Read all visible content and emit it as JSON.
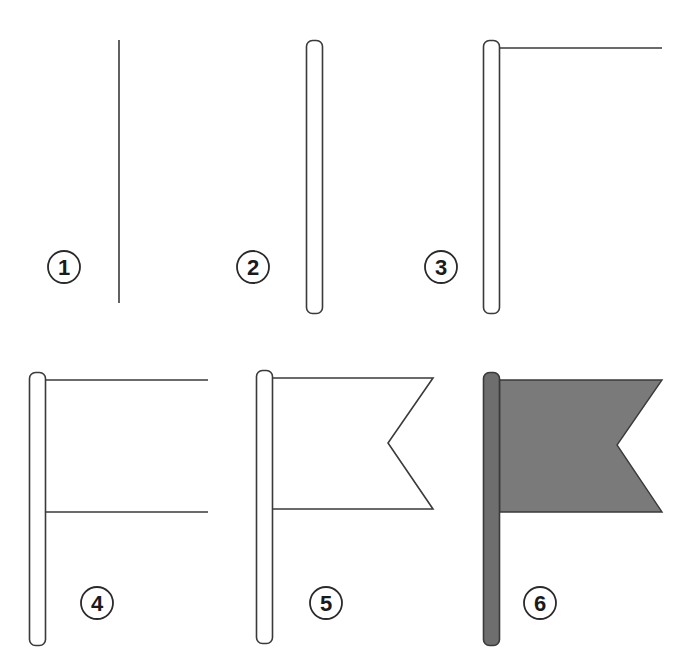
{
  "colors": {
    "background": "#ffffff",
    "stroke": "#3a3a3a",
    "pole_fill_final": "#6e6e6e",
    "flag_fill_final": "#7a7a7a"
  },
  "steps": [
    {
      "number": "1",
      "description": "Draw a vertical line"
    },
    {
      "number": "2",
      "description": "Thicken the line into a rounded pole"
    },
    {
      "number": "3",
      "description": "Add a horizontal top edge"
    },
    {
      "number": "4",
      "description": "Add a parallel bottom edge"
    },
    {
      "number": "5",
      "description": "Close the flag with a notched swallowtail end"
    },
    {
      "number": "6",
      "description": "Color the pole and flag"
    }
  ]
}
